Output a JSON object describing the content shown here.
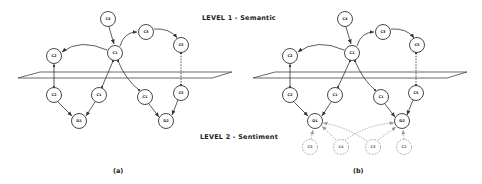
{
  "labels": {
    "level1": "LEVEL 1 - Semantic",
    "level2": "LEVEL 2 - Sentiment"
  },
  "panels": [
    {
      "caption": "(a)",
      "upper_nodes": [
        "C4",
        "C1",
        "C2",
        "C3",
        "C5"
      ],
      "lower_nodes": [
        "C2",
        "C1",
        "C1",
        "C5"
      ],
      "sentiment_nodes": [
        "D1",
        "D2"
      ]
    },
    {
      "caption": "(b)",
      "upper_nodes": [
        "C4",
        "C1",
        "C2",
        "C3",
        "C5"
      ],
      "lower_nodes": [
        "C2",
        "C1",
        "C1",
        "C5"
      ],
      "sentiment_nodes": [
        "D1",
        "D2"
      ],
      "ghost_nodes": [
        "C5",
        "C4",
        "C3",
        "C2"
      ]
    }
  ],
  "colors": {
    "stroke": "#333333",
    "ghost_stroke": "#9a9a9a",
    "background": "#ffffff"
  }
}
